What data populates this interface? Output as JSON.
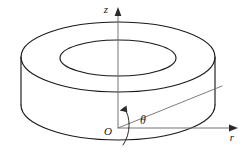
{
  "figure": {
    "title": "Annular disk in cylindrical coordinates",
    "background_color": "#ffffff",
    "line_color": "#1a1a1a",
    "axis_color": "#6e6e6e",
    "labels": {
      "z_axis": "z",
      "r_axis": "r",
      "origin": "O",
      "angle": "θ"
    },
    "geometry": {
      "shape": "annulus",
      "outer_ellipse": {
        "center_x": 118,
        "center_y": 57,
        "radius_x": 97,
        "radius_y": 35
      },
      "inner_ellipse": {
        "center_x": 118,
        "center_y": 58,
        "radius_x": 58,
        "radius_y": 18
      },
      "thickness": 48,
      "z_axis": {
        "x": 118,
        "y_top": 12,
        "y_bottom": 128
      },
      "r_axis": {
        "y": 128,
        "x_left": 118,
        "x_right": 236
      },
      "radial_ray": {
        "x1": 118,
        "y1": 128,
        "x2": 222,
        "y2": 86
      },
      "angle_arc_label_position": {
        "x": 141,
        "y": 118
      }
    }
  }
}
